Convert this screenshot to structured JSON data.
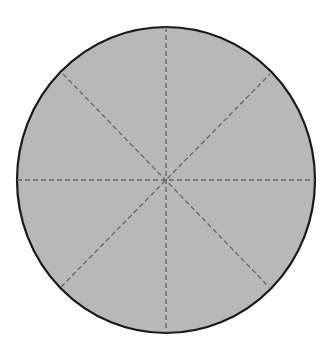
{
  "diagram": {
    "shape": "circle",
    "divisions": 8,
    "fill_color": "#b8b8b8",
    "outline_color": "#1a1a1a",
    "divider_color": "#666666",
    "divider_style": "dashed",
    "divider_angles_deg": [
      0,
      45,
      90,
      135
    ]
  }
}
